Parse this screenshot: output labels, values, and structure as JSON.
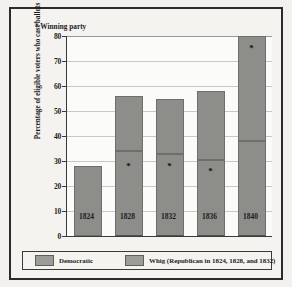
{
  "chart_data": {
    "type": "bar",
    "title": "",
    "subtype": "stacked",
    "xlabel": "",
    "ylabel": "Percentage of eligible voters who cast ballots",
    "ylim": [
      0,
      80
    ],
    "ytick_step": 10,
    "yticks": [
      "80",
      "70",
      "60",
      "50",
      "40",
      "30",
      "20",
      "10",
      "0"
    ],
    "grid": true,
    "legend_position": "bottom",
    "categories": [
      "1824",
      "1828",
      "1832",
      "1836",
      "1840"
    ],
    "series": [
      {
        "name": "Democratic",
        "values": [
          28,
          34,
          33,
          30.5,
          38
        ]
      },
      {
        "name": "Whig (Republican in 1824, 1828, and 1832)",
        "values": [
          0,
          22,
          22,
          27.5,
          42
        ]
      }
    ],
    "totals": [
      28,
      56,
      55,
      58,
      80
    ],
    "annotations": [
      {
        "text": "* Winning party",
        "x": 0.12,
        "y": 75
      },
      {
        "marker": "*",
        "category": "1828",
        "value": 27,
        "segment": "Democratic"
      },
      {
        "marker": "*",
        "category": "1832",
        "value": 27,
        "segment": "Democratic"
      },
      {
        "marker": "*",
        "category": "1836",
        "value": 25,
        "segment": "Democratic"
      },
      {
        "marker": "*",
        "category": "1840",
        "value": 74,
        "segment": "Whig"
      }
    ],
    "colors": {
      "democratic": "#8d8d8a",
      "whig": "#8d8d8a",
      "plot_background": "#fbfbf9",
      "figure_background": "#f4f3f0",
      "axis": "#3a3a3a",
      "grid": "#c9c9c4"
    }
  },
  "annotation": {
    "winning_party_note": "* Winning party"
  },
  "axis": {
    "y_label": "Percentage of eligible voters who cast ballots",
    "y_ticks": [
      "80",
      "70",
      "60",
      "50",
      "40",
      "30",
      "20",
      "10",
      "0"
    ],
    "x_ticks": [
      "1824",
      "1828",
      "1832",
      "1836",
      "1840"
    ]
  },
  "legend": {
    "entries": [
      {
        "label": "Democratic",
        "color": "#9c9c99"
      },
      {
        "label": "Whig (Republican in 1824, 1828, and 1832)",
        "color": "#9c9c99"
      }
    ]
  },
  "star_marker": "*"
}
